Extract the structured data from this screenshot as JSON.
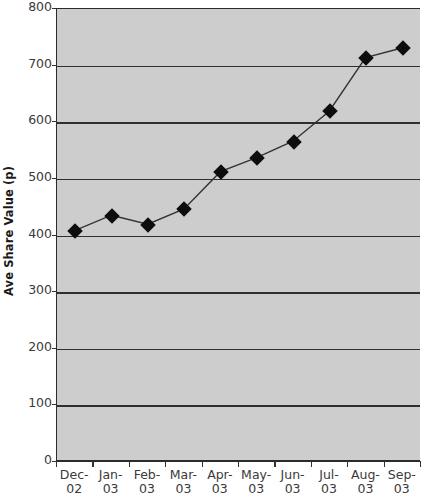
{
  "chart_data": {
    "type": "line",
    "title": "",
    "xlabel": "",
    "ylabel": "Ave Share Value (p)",
    "categories": [
      "Dec-02",
      "Jan-03",
      "Feb-03",
      "Mar-03",
      "Apr-03",
      "May-03",
      "Jun-03",
      "Jul-03",
      "Aug-03",
      "Sep-03"
    ],
    "category_lines": [
      [
        "Dec-",
        "02"
      ],
      [
        "Jan-",
        "03"
      ],
      [
        "Feb-",
        "03"
      ],
      [
        "Mar-",
        "03"
      ],
      [
        "Apr-",
        "03"
      ],
      [
        "May-",
        "03"
      ],
      [
        "Jun-",
        "03"
      ],
      [
        "Jul-",
        "03"
      ],
      [
        "Aug-",
        "03"
      ],
      [
        "Sep-",
        "03"
      ]
    ],
    "values": [
      408,
      435,
      419,
      446,
      512,
      537,
      566,
      619,
      714,
      731
    ],
    "ylim": [
      0,
      800
    ],
    "yticks": [
      0,
      100,
      200,
      300,
      400,
      500,
      600,
      700,
      800
    ],
    "ytick_labels": [
      "0",
      "100",
      "200",
      "300",
      "400",
      "500",
      "600",
      "700",
      "800"
    ],
    "grid": true,
    "legend": false,
    "marker": "diamond",
    "marker_color": "#0d0d0d",
    "line_color": "#333333",
    "plot_background": "#cdcdcd",
    "gridline_color": "#2f2f2f"
  }
}
